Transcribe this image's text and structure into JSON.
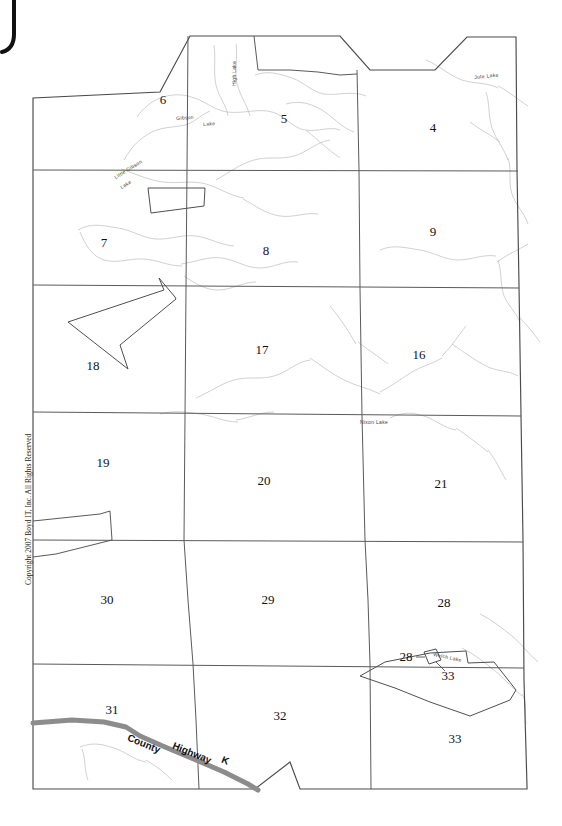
{
  "document": {
    "kind": "township-plat-map",
    "copyright": "Copyright 2007 Boyd IT, Inc. All Rights Reserved",
    "corner_mark": "J"
  },
  "sections": [
    {
      "label": "6",
      "x": 163,
      "y": 100
    },
    {
      "label": "5",
      "x": 284,
      "y": 119
    },
    {
      "label": "4",
      "x": 433,
      "y": 128
    },
    {
      "label": "7",
      "x": 104,
      "y": 243
    },
    {
      "label": "8",
      "x": 266,
      "y": 251
    },
    {
      "label": "9",
      "x": 433,
      "y": 232
    },
    {
      "label": "18",
      "x": 93,
      "y": 366
    },
    {
      "label": "17",
      "x": 262,
      "y": 350
    },
    {
      "label": "16",
      "x": 419,
      "y": 355
    },
    {
      "label": "19",
      "x": 103,
      "y": 463
    },
    {
      "label": "20",
      "x": 264,
      "y": 481
    },
    {
      "label": "21",
      "x": 441,
      "y": 484
    },
    {
      "label": "30",
      "x": 107,
      "y": 600
    },
    {
      "label": "29",
      "x": 268,
      "y": 600
    },
    {
      "label": "28",
      "x": 444,
      "y": 603
    },
    {
      "label": "31",
      "x": 112,
      "y": 710
    },
    {
      "label": "32",
      "x": 280,
      "y": 716
    },
    {
      "label": "33",
      "x": 455,
      "y": 739
    }
  ],
  "hydro_labels": [
    {
      "name": "Gibson",
      "x": 176,
      "y": 115,
      "rotate": -4
    },
    {
      "name": "Lake",
      "x": 203,
      "y": 121,
      "rotate": -4
    },
    {
      "name": "High  Lake",
      "x": 231,
      "y": 86,
      "rotate": -90
    },
    {
      "name": "Little  Gibson",
      "x": 113,
      "y": 175,
      "rotate": -32
    },
    {
      "name": "Lake",
      "x": 119,
      "y": 185,
      "rotate": -32
    },
    {
      "name": "Jute  Lake",
      "x": 474,
      "y": 74,
      "rotate": -6
    },
    {
      "name": "Nixon  Lake",
      "x": 360,
      "y": 419,
      "rotate": 0
    },
    {
      "name": "Welch  Lake",
      "x": 434,
      "y": 651,
      "rotate": 12
    }
  ],
  "road": {
    "name": "County Highway K",
    "words": [
      {
        "text": "County",
        "x": 130,
        "y": 732,
        "rotate": 22
      },
      {
        "text": "Highway",
        "x": 175,
        "y": 740,
        "rotate": 22
      },
      {
        "text": "K",
        "x": 224,
        "y": 754,
        "rotate": 22
      }
    ],
    "color": "#8c8c8c"
  },
  "callouts": [
    {
      "label": "28",
      "x": 406,
      "y": 657
    },
    {
      "label": "33",
      "x": 448,
      "y": 676
    }
  ],
  "colors": {
    "boundary": "#4a4a4a",
    "section_line": "#6d6d6d",
    "hydro": "#b9b9b9",
    "parcel": "#555555",
    "road": "#8c8c8c",
    "background": "#ffffff"
  }
}
